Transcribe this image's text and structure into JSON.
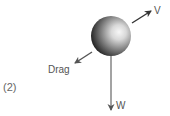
{
  "figure": {
    "number_label": "(2)",
    "object": "sphere",
    "forces": [
      {
        "id": "velocity",
        "label": "V",
        "direction": "up-right"
      },
      {
        "id": "drag",
        "label": "Drag",
        "direction": "down-left"
      },
      {
        "id": "weight",
        "label": "W",
        "direction": "down"
      }
    ]
  },
  "colors": {
    "arrow": "#555555",
    "text": "#555555",
    "sphere_dark": "#1a1a1a",
    "sphere_light": "#f2f2f2"
  }
}
